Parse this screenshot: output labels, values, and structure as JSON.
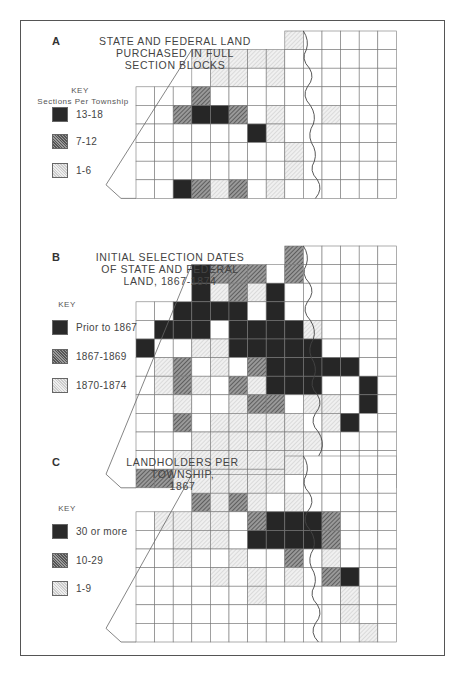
{
  "panels": [
    {
      "letter": "A",
      "title": "STATE AND FEDERAL LAND\nPURCHASED IN FULL\nSECTION BLOCKS",
      "key": {
        "title": "KEY",
        "subtitle": "Sections Per Township",
        "items": [
          {
            "label": "13-18",
            "shade": 3
          },
          {
            "label": "7-12",
            "shade": 2
          },
          {
            "label": "1-6",
            "shade": 1
          }
        ]
      }
    },
    {
      "letter": "B",
      "title": "INITIAL SELECTION DATES\nOF STATE AND FEDERAL\nLAND, 1867-1874",
      "key": {
        "title": "KEY",
        "subtitle": "",
        "items": [
          {
            "label": "Prior to 1867",
            "shade": 3
          },
          {
            "label": "1867-1869",
            "shade": 2
          },
          {
            "label": "1870-1874",
            "shade": 1
          }
        ]
      }
    },
    {
      "letter": "C",
      "title": "LANDHOLDERS PER TOWNSHIP,\n1867",
      "key": {
        "title": "KEY",
        "subtitle": "",
        "items": [
          {
            "label": "30 or more",
            "shade": 3
          },
          {
            "label": "10-29",
            "shade": 2
          },
          {
            "label": "1-9",
            "shade": 1
          }
        ]
      }
    }
  ],
  "maps": [
    {
      "top": 31,
      "rows": [
        "........1....",
        "...11111.....",
        "....11.1.....",
        "...2.........",
        "..2332.1..1..",
        "......31.....",
        "........1....",
        "........1....",
        "..3212.1....."
      ]
    },
    {
      "top": 246,
      "rows": [
        "........2....",
        "...3222.2....",
        "...31213.....",
        "..3333.3....",
        ".333.33331...",
        "3..1133333...",
        ".12.1.233333.",
        ".121.21333..3",
        "..1..122.11.3",
        "..2.11111.13.",
        "...1111111...",
        "..1111111....",
        "221111111...."
      ]
    },
    {
      "top": 456,
      "rows": [
        "........1....",
        "...11111.....",
        "...2121.1....",
        ".1111.23332..",
        "..111.33332..",
        "..1..1..2.1..",
        "....1.1.1.23.",
        "......1....1.",
        "...........1.",
        "............1"
      ]
    }
  ]
}
